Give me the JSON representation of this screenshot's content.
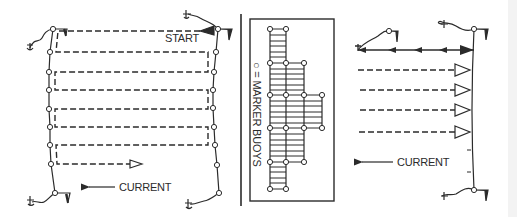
{
  "figure": {
    "colors": {
      "ink": "#2b2b2b",
      "background": "#ffffff"
    },
    "left_panel": {
      "start_label": "START",
      "current_label": "CURRENT",
      "lane_rows_y": [
        31,
        52,
        72,
        90,
        109,
        127,
        145,
        164
      ],
      "left_buoys": [
        [
          53,
          29
        ],
        [
          50,
          52
        ],
        [
          49,
          72
        ],
        [
          49,
          90
        ],
        [
          49,
          109
        ],
        [
          50,
          127
        ],
        [
          50,
          145
        ],
        [
          51,
          164
        ],
        [
          55,
          193
        ]
      ],
      "right_buoys": [
        [
          218,
          29
        ],
        [
          216,
          52
        ],
        [
          214,
          72
        ],
        [
          213,
          90
        ],
        [
          213,
          108
        ],
        [
          214,
          127
        ],
        [
          215,
          145
        ],
        [
          217,
          165
        ],
        [
          219,
          193
        ]
      ]
    },
    "middle_panel": {
      "legend_label": "○ = MARKER BUOYS",
      "buoys": [
        [
          270,
          29
        ],
        [
          286,
          29
        ],
        [
          270,
          63
        ],
        [
          286,
          63
        ],
        [
          304,
          63
        ],
        [
          270,
          95
        ],
        [
          286,
          95
        ],
        [
          304,
          95
        ],
        [
          322,
          95
        ],
        [
          270,
          128
        ],
        [
          286,
          128
        ],
        [
          304,
          128
        ],
        [
          322,
          128
        ],
        [
          270,
          162
        ],
        [
          286,
          162
        ],
        [
          304,
          162
        ],
        [
          270,
          189
        ],
        [
          286,
          189
        ]
      ]
    },
    "right_panel": {
      "current_label": "CURRENT",
      "dashed_rows_y": [
        70,
        90,
        110,
        132
      ]
    }
  }
}
